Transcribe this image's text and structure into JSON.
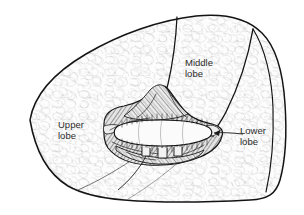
{
  "figure": {
    "background_color": "#ffffff",
    "ink_color": "#1a1a1a",
    "text_color": "#2b2b2b",
    "shading_color": "#555555",
    "parenchyma_fill": "#fdfdfd"
  },
  "labels": {
    "upper": {
      "line1": "Upper",
      "line2": "lobe"
    },
    "middle": {
      "line1": "Middle",
      "line2": "lobe"
    },
    "lower": {
      "line1": "Lower",
      "line2": "lobe"
    }
  },
  "structures": {
    "hilum": "hilum-region",
    "bronchus": "main-bronchus",
    "horizontal_fissure": "horizontal-fissure",
    "oblique_fissure": "oblique-fissure",
    "leader_line_lower": "lower-lobe-leader"
  }
}
